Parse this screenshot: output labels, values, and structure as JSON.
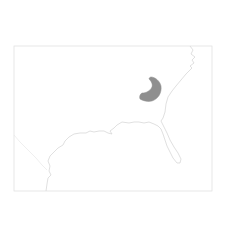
{
  "map": {
    "type": "species-range-map",
    "region": "Southeastern United States",
    "colors": {
      "background": "#ffffff",
      "outline": "#d4d4d4",
      "range_fill": "#8f8f8f"
    },
    "range_area": {
      "label": "range",
      "approx_location": "eastern Georgia / South Carolina interior"
    }
  }
}
